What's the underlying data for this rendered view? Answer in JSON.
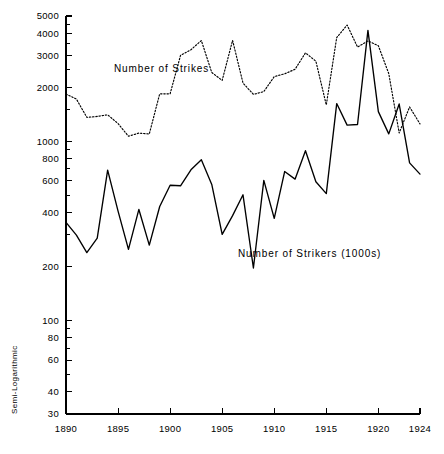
{
  "chart_data": {
    "type": "line",
    "title": "",
    "xlabel": "",
    "ylabel": "Semi-Logarithmic",
    "scale": "log",
    "grid": false,
    "legend_position": "inline-annotations",
    "xlim": [
      1890,
      1924
    ],
    "ylim": [
      30,
      5000
    ],
    "x_ticks": [
      1890,
      1895,
      1900,
      1905,
      1910,
      1915,
      1920,
      1924
    ],
    "x_tick_labels": [
      "1890",
      "1895",
      "1900",
      "1905",
      "1910",
      "1915",
      "1920",
      "1924"
    ],
    "y_ticks": [
      30,
      40,
      60,
      80,
      100,
      200,
      400,
      600,
      800,
      1000,
      2000,
      3000,
      4000,
      5000
    ],
    "y_tick_labels": [
      "30",
      "40",
      "60",
      "80",
      "100",
      "200",
      "400",
      "600",
      "800",
      "1000",
      "2000",
      "3000",
      "4000",
      "5000"
    ],
    "y_minor_ticks": [
      50,
      70,
      90,
      300,
      500,
      700,
      900,
      1500,
      2500,
      3500,
      4500
    ],
    "x": [
      1890,
      1891,
      1892,
      1893,
      1894,
      1895,
      1896,
      1897,
      1898,
      1899,
      1900,
      1901,
      1902,
      1903,
      1904,
      1905,
      1906,
      1907,
      1908,
      1909,
      1910,
      1911,
      1912,
      1913,
      1914,
      1915,
      1916,
      1917,
      1918,
      1919,
      1920,
      1921,
      1922,
      1923,
      1924
    ],
    "series": [
      {
        "name": "Number of Strikes",
        "style": "dotted",
        "label_text": "Number of Strikes",
        "label_x": 1894.6,
        "label_y": 2430,
        "values": [
          1833,
          1719,
          1359,
          1375,
          1404,
          1255,
          1066,
          1110,
          1098,
          1838,
          1839,
          3012,
          3240,
          3648,
          2419,
          2186,
          3655,
          2112,
          1826,
          1892,
          2294,
          2379,
          2520,
          3113,
          2796,
          1593,
          3789,
          4450,
          3353,
          3630,
          3411,
          2385,
          1112,
          1553,
          1249
        ],
        "value_note": "counts of strikes per year"
      },
      {
        "name": "Number of Strikers (1000s)",
        "style": "solid",
        "label_text": "Number of Strikers (1000s)",
        "label_x": 1913.4,
        "label_y": 226,
        "values": [
          352,
          299,
          239,
          288,
          690,
          407,
          249,
          416,
          263,
          432,
          568,
          564,
          692,
          788,
          574,
          302,
          384,
          502,
          196,
          604,
          371,
          677,
          614,
          885,
          594,
          510,
          1622,
          1230,
          1240,
          4160,
          1463,
          1099,
          1613,
          757,
          655
        ],
        "value_note": "thousands of strikers per year"
      }
    ]
  },
  "axis_label": {
    "text": "Semi-Logarithmic"
  },
  "plot_geometry": {
    "left": 66,
    "right": 420,
    "top": 16,
    "bottom": 414
  }
}
